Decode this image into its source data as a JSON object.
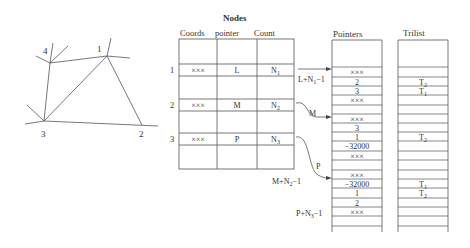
{
  "graph": {
    "nodes": [
      {
        "id": "1",
        "x": 107,
        "y": 56
      },
      {
        "id": "2",
        "x": 142,
        "y": 125
      },
      {
        "id": "3",
        "x": 44,
        "y": 121
      },
      {
        "id": "4",
        "x": 50,
        "y": 63
      }
    ],
    "labels": {
      "n1": "1",
      "n2": "2",
      "n3": "3",
      "n4": "4"
    }
  },
  "nodes_table": {
    "title": "Nodes",
    "headers": [
      "Coords",
      "pointer",
      "Count"
    ],
    "rows": [
      {
        "index": "1",
        "coords": "×××",
        "pointer": "L",
        "count": "N",
        "count_sub": "1"
      },
      {
        "index": "2",
        "coords": "×××",
        "pointer": "M",
        "count": "N",
        "count_sub": "2"
      },
      {
        "index": "3",
        "coords": "×××",
        "pointer": "P",
        "count": "N",
        "count_sub": "3"
      }
    ]
  },
  "arrows": {
    "a1": "L+N",
    "a1_sub": "1",
    "a1_tail": "−1",
    "a2": "M",
    "a3": "P",
    "a4": "M+N",
    "a4_sub": "2",
    "a4_tail": "−1",
    "a5": "P+N",
    "a5_sub": "3",
    "a5_tail": "−1"
  },
  "pointers": {
    "title": "Pointers",
    "cells": [
      "×××",
      "2",
      "3",
      "×××",
      "",
      "×××",
      "3",
      "1",
      "−32000",
      "×××",
      "",
      "×××",
      "−32000",
      "1",
      "2",
      "×××",
      "",
      ""
    ]
  },
  "trilist": {
    "title": "Trilist",
    "cells": [
      {
        "t": "",
        "s": ""
      },
      {
        "t": "T",
        "s": "2"
      },
      {
        "t": "T",
        "s": "1"
      },
      {
        "t": "",
        "s": ""
      },
      {
        "t": "",
        "s": ""
      },
      {
        "t": "",
        "s": ""
      },
      {
        "t": "",
        "s": ""
      },
      {
        "t": "T",
        "s": "2"
      },
      {
        "t": "",
        "s": ""
      },
      {
        "t": "",
        "s": ""
      },
      {
        "t": "",
        "s": ""
      },
      {
        "t": "",
        "s": ""
      },
      {
        "t": "T",
        "s": "1"
      },
      {
        "t": "T",
        "s": "2"
      },
      {
        "t": "",
        "s": ""
      },
      {
        "t": "",
        "s": ""
      },
      {
        "t": "",
        "s": ""
      },
      {
        "t": "",
        "s": ""
      }
    ]
  }
}
